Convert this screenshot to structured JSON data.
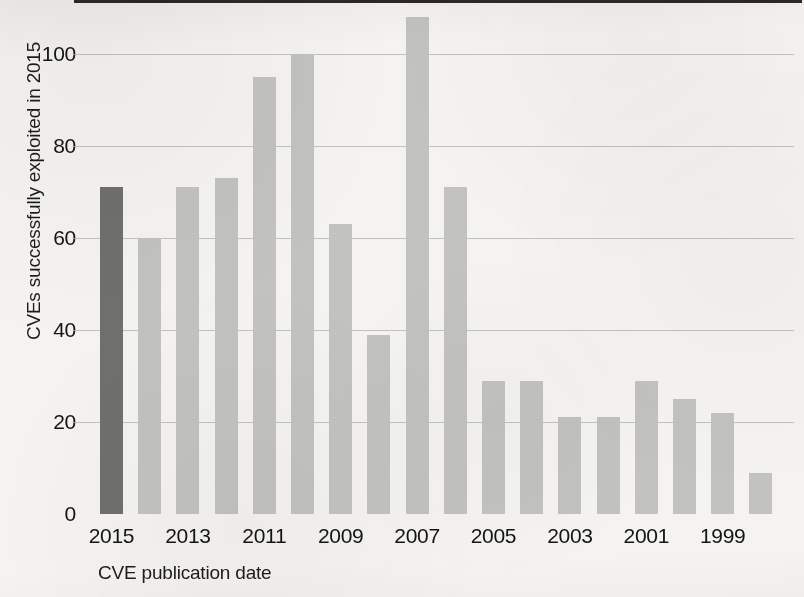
{
  "chart_data": {
    "type": "bar",
    "title": "",
    "xlabel": "CVE publication date",
    "ylabel": "CVEs successfully exploited in 2015",
    "categories": [
      "2015",
      "2014",
      "2013",
      "2012",
      "2011",
      "2010",
      "2009",
      "2008",
      "2007",
      "2006",
      "2005",
      "2004",
      "2003",
      "2002",
      "2001",
      "2000",
      "1999",
      "1998"
    ],
    "values": [
      71,
      60,
      71,
      73,
      95,
      100,
      63,
      39,
      108,
      71,
      29,
      29,
      21,
      21,
      29,
      25,
      22,
      9
    ],
    "highlighted_category": "2015",
    "x_tick_labels": [
      "2015",
      "2013",
      "2011",
      "2009",
      "2007",
      "2005",
      "2003",
      "2001",
      "1999"
    ],
    "y_tick_labels": [
      "100",
      "80",
      "60",
      "40",
      "20",
      "0"
    ],
    "y_tick_values": [
      100,
      80,
      60,
      40,
      20,
      0
    ],
    "ylim": [
      0,
      112
    ],
    "grid": true,
    "legend": "none",
    "colors": {
      "bar": "#c2c2be",
      "bar_highlight": "#6f6f6d",
      "gridline": "#b9b9b4",
      "axis": "#2a2a2a",
      "text": "#151515",
      "background": "#f4f3f0"
    }
  }
}
